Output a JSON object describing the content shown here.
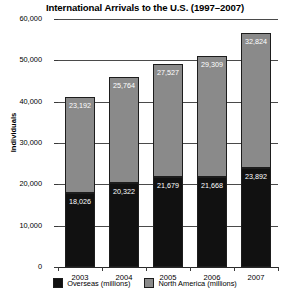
{
  "chart_data": {
    "type": "bar",
    "subtype": "stacked-bar",
    "title": "International Arrivals to the U.S. (1997–2007)",
    "xlabel": "",
    "ylabel": "Individuals",
    "categories": [
      "2003",
      "2004",
      "2005",
      "2006",
      "2007"
    ],
    "ylim": [
      0,
      60000
    ],
    "yticks": [
      0,
      10000,
      20000,
      30000,
      40000,
      50000,
      60000
    ],
    "ytick_labels": [
      "0",
      "10,000",
      "20,000",
      "30,000",
      "40,000",
      "50,000",
      "60,000"
    ],
    "grid": true,
    "legend_position": "bottom",
    "series": [
      {
        "name": "Overseas (millions)",
        "color": "#111111",
        "values": [
          18026,
          20322,
          21679,
          21668,
          23892
        ],
        "value_labels": [
          "18,026",
          "20,322",
          "21,679",
          "21,668",
          "23,892"
        ]
      },
      {
        "name": "North America (millions)",
        "color": "#8a8a8a",
        "values": [
          23192,
          25764,
          27527,
          29309,
          32824
        ],
        "value_labels": [
          "23,192",
          "25,764",
          "27,527",
          "29,309",
          "32,824"
        ]
      }
    ]
  }
}
